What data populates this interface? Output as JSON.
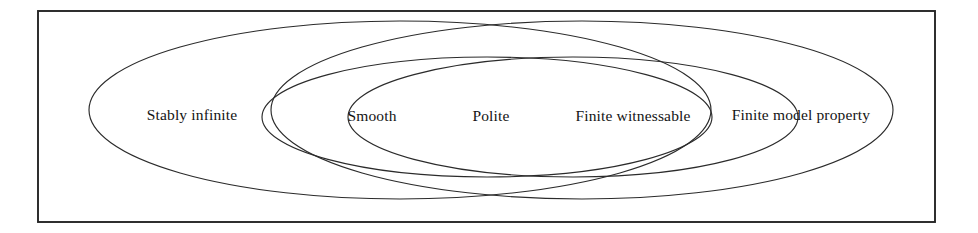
{
  "figure": {
    "kind": "venn-diagram",
    "background_color": "#ffffff",
    "stroke_color": "#2b2b2b",
    "frame_color": "#252525",
    "text_color": "#141414",
    "width": 978,
    "height": 233
  },
  "frame": {
    "name": "outer-border",
    "x": 38,
    "y": 11,
    "width": 897,
    "height": 211
  },
  "regions": [
    {
      "id": "stably-infinite",
      "label": "Stably infinite",
      "shape": "ellipse",
      "cx": 400,
      "cy": 110,
      "rx": 311,
      "ry": 89,
      "label_x": 192,
      "label_y": 116
    },
    {
      "id": "smooth",
      "label": "Smooth",
      "shape": "ellipse",
      "cx": 487,
      "cy": 117,
      "rx": 225,
      "ry": 60,
      "label_x": 372,
      "label_y": 117
    },
    {
      "id": "polite",
      "label": "Polite",
      "shape": "lens-intersection",
      "intersection_of": [
        "smooth",
        "finite-witnessable"
      ],
      "label_x": 491,
      "label_y": 117
    },
    {
      "id": "finite-witnessable",
      "label": "Finite witnessable",
      "shape": "ellipse",
      "cx": 573,
      "cy": 117,
      "rx": 225,
      "ry": 60,
      "label_x": 633,
      "label_y": 117
    },
    {
      "id": "finite-model-property",
      "label": "Finite model property",
      "shape": "ellipse",
      "cx": 582,
      "cy": 110,
      "rx": 311,
      "ry": 89,
      "label_x": 801,
      "label_y": 116
    }
  ]
}
